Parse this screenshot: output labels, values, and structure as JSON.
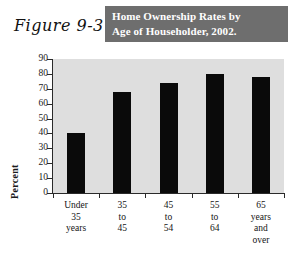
{
  "figure": {
    "label": "Figure 9-3",
    "title": "Home Ownership Rates by\nAge of Householder, 2002.",
    "banner_color": "#6e6e6e",
    "banner_text_color": "#ffffff",
    "plot_background": "#dedede",
    "bar_color": "#0a0a0a"
  },
  "chart_data": {
    "type": "bar",
    "title": "Home Ownership Rates by Age of Householder, 2002.",
    "categories": [
      "Under\n35\nyears",
      "35\nto\n45",
      "45\nto\n54",
      "55\nto\n64",
      "65\nyears\nand\nover"
    ],
    "values": [
      40,
      68,
      74,
      80,
      78
    ],
    "xlabel": "",
    "ylabel": "Percent",
    "ylim": [
      0,
      90
    ],
    "yticks": [
      0,
      10,
      20,
      30,
      40,
      50,
      60,
      70,
      80,
      90
    ],
    "ytick_labels": [
      "0",
      "10",
      "20",
      "30",
      "40",
      "50",
      "60",
      "70",
      "80",
      "90"
    ],
    "grid": false,
    "legend": null
  }
}
